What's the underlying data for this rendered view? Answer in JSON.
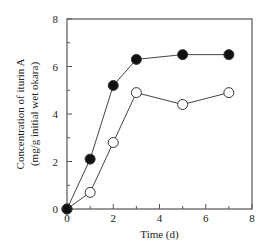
{
  "chart_data": {
    "type": "line",
    "title": "",
    "xlabel": "Time (d)",
    "ylabel_line1": "Concentration of iturin A",
    "ylabel_line2": "(mg/g initial wet okara)",
    "xlim": [
      0,
      8
    ],
    "ylim": [
      0,
      8
    ],
    "x_ticks": [
      0,
      2,
      4,
      6,
      8
    ],
    "y_ticks": [
      0,
      2,
      4,
      6,
      8
    ],
    "x_minor_ticks": [
      1,
      3,
      5,
      7
    ],
    "y_minor_ticks": [
      1,
      3,
      5,
      7
    ],
    "grid": false,
    "legend": "none",
    "series": [
      {
        "name": "filled-circles",
        "marker": "filled-circle",
        "x": [
          0,
          1,
          2,
          3,
          5,
          7
        ],
        "values": [
          0,
          2.1,
          5.2,
          6.3,
          6.5,
          6.5
        ]
      },
      {
        "name": "open-circles",
        "marker": "open-circle",
        "x": [
          0,
          1,
          2,
          3,
          5,
          7
        ],
        "values": [
          0,
          0.7,
          2.8,
          4.9,
          4.4,
          4.9
        ]
      }
    ]
  }
}
